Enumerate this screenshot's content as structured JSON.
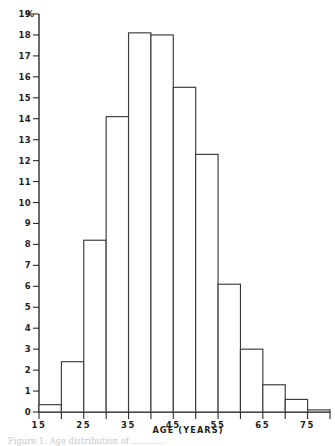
{
  "chart_data": {
    "type": "bar",
    "title": "",
    "subtitle": "",
    "xlabel": "AGE  (YEARS)",
    "ylabel": "%",
    "xlim": [
      15,
      80
    ],
    "ylim": [
      0,
      19
    ],
    "grid": false,
    "legend": null,
    "bin_width": 5,
    "bin_edges": [
      15,
      20,
      25,
      30,
      35,
      40,
      45,
      50,
      55,
      60,
      65,
      70,
      75,
      80
    ],
    "categories": [
      "15-20",
      "20-25",
      "25-30",
      "30-35",
      "35-40",
      "40-45",
      "45-50",
      "50-55",
      "55-60",
      "60-65",
      "65-70",
      "70-75",
      "75-80"
    ],
    "values": [
      0.35,
      2.4,
      8.2,
      14.1,
      18.1,
      18.0,
      15.5,
      12.3,
      6.1,
      3.0,
      1.3,
      0.6,
      0.1
    ],
    "x_ticks": [
      15,
      20,
      25,
      30,
      35,
      40,
      45,
      50,
      55,
      60,
      65,
      70,
      75,
      80
    ],
    "x_tick_labels": [
      "15",
      "",
      "25",
      "",
      "35",
      "",
      "45",
      "",
      "55",
      "",
      "65",
      "",
      "75",
      ""
    ],
    "y_ticks": [
      0,
      1,
      2,
      3,
      4,
      5,
      6,
      7,
      8,
      9,
      10,
      11,
      12,
      13,
      14,
      15,
      16,
      17,
      18,
      19
    ],
    "y_tick_labels": [
      "0",
      "1",
      "2",
      "3",
      "4",
      "5",
      "6",
      "7",
      "8",
      "9",
      "10",
      "11",
      "12",
      "13",
      "14",
      "15",
      "16",
      "17",
      "18",
      "19"
    ],
    "colors": {
      "bar_fill": "#ffffff",
      "bar_stroke": "#3a3a3a",
      "axis": "#2a2a2a",
      "text": "#1f1f1f",
      "background": "#ffffff"
    }
  },
  "caption": {
    "text": "Figure  1.  Age  distribution  of  ............",
    "visible": "partially-cropped"
  }
}
